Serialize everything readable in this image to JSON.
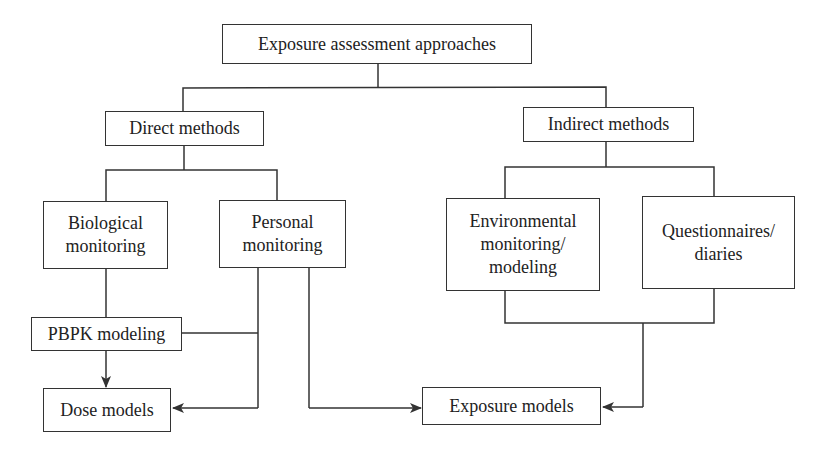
{
  "diagram": {
    "title_node": "Exposure assessment approaches",
    "nodes": {
      "root": {
        "label": "Exposure assessment approaches"
      },
      "direct": {
        "label": "Direct methods"
      },
      "indirect": {
        "label": "Indirect methods"
      },
      "biological": {
        "line1": "Biological",
        "line2": "monitoring"
      },
      "personal": {
        "line1": "Personal",
        "line2": "monitoring"
      },
      "environmental": {
        "line1": "Environmental",
        "line2": "monitoring/",
        "line3": "modeling"
      },
      "questionnaires": {
        "line1": "Questionnaires/",
        "line2": "diaries"
      },
      "pbpk": {
        "label": "PBPK modeling"
      },
      "dose": {
        "label": "Dose models"
      },
      "exposure": {
        "label": "Exposure models"
      }
    },
    "edges": [
      {
        "from": "Exposure assessment approaches",
        "to": "Direct methods",
        "type": "tree"
      },
      {
        "from": "Exposure assessment approaches",
        "to": "Indirect methods",
        "type": "tree"
      },
      {
        "from": "Direct methods",
        "to": "Biological monitoring",
        "type": "tree"
      },
      {
        "from": "Direct methods",
        "to": "Personal monitoring",
        "type": "tree"
      },
      {
        "from": "Indirect methods",
        "to": "Environmental monitoring/modeling",
        "type": "tree"
      },
      {
        "from": "Indirect methods",
        "to": "Questionnaires/diaries",
        "type": "tree"
      },
      {
        "from": "Biological monitoring",
        "to": "PBPK modeling",
        "type": "line"
      },
      {
        "from": "Personal monitoring",
        "to": "PBPK modeling",
        "type": "line"
      },
      {
        "from": "PBPK modeling",
        "to": "Dose models",
        "type": "arrow"
      },
      {
        "from": "Personal monitoring",
        "to": "Dose models",
        "type": "arrow"
      },
      {
        "from": "Personal monitoring",
        "to": "Exposure models",
        "type": "arrow"
      },
      {
        "from": "Environmental monitoring/modeling + Questionnaires/diaries",
        "to": "Exposure models",
        "type": "arrow"
      }
    ],
    "colors": {
      "stroke": "#333333",
      "background": "#ffffff",
      "text": "#222222"
    }
  }
}
